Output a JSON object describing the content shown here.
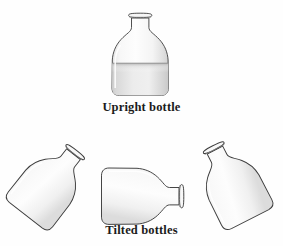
{
  "figure": {
    "background_color": "#fefefe",
    "outline_color": "#3a3a3a",
    "glass_fill_top": "#fbfbfb",
    "glass_fill_bottom": "#e9e9e9",
    "liquid_fill_top": "#d3d3d3",
    "liquid_fill_bottom": "#f2f2f2",
    "caption_color": "#1b1b1b"
  },
  "captions": {
    "upright": "Upright bottle",
    "tilted": "Tilted bottles"
  },
  "bottles": [
    {
      "id": "upright-bottle",
      "label": "Upright bottle",
      "orientation": "upright",
      "rotation_deg": 0,
      "has_liquid": true,
      "fill_level_fraction": 0.55
    },
    {
      "id": "tilted-bottle-left",
      "label": "Tilted bottle left",
      "orientation": "tilted",
      "rotation_deg": 38,
      "has_liquid": false,
      "fill_level_fraction": 0
    },
    {
      "id": "tilted-bottle-middle",
      "label": "Tilted bottle middle",
      "orientation": "horizontal",
      "rotation_deg": 90,
      "has_liquid": false,
      "fill_level_fraction": 0
    },
    {
      "id": "tilted-bottle-right",
      "label": "Tilted bottle right",
      "orientation": "tilted",
      "rotation_deg": -27,
      "has_liquid": false,
      "fill_level_fraction": 0
    }
  ]
}
